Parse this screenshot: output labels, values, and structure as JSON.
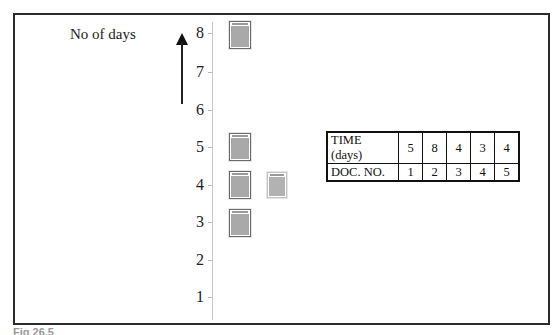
{
  "diagram": {
    "y_axis_label": "No of days",
    "y_ticks": [
      "8",
      "7",
      "6",
      "5",
      "4",
      "3",
      "2",
      "1"
    ],
    "documents": [
      {
        "doc_no": 1,
        "days": 5
      },
      {
        "doc_no": 2,
        "days": 8
      },
      {
        "doc_no": 3,
        "days": 4
      },
      {
        "doc_no": 4,
        "days": 3
      },
      {
        "doc_no": 5,
        "days": 4
      }
    ],
    "table": {
      "row1_header": "TIME (days)",
      "row1_values": [
        "5",
        "8",
        "4",
        "3",
        "4"
      ],
      "row2_header": "DOC. NO.",
      "row2_values": [
        "1",
        "2",
        "3",
        "4",
        "5"
      ]
    },
    "caption": "Fig 26.5"
  }
}
